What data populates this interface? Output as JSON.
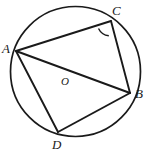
{
  "figure": {
    "type": "circle-geometry-diagram",
    "width": 153,
    "height": 155,
    "background_color": "#ffffff",
    "stroke_color": "#1a1a1a",
    "circle": {
      "name": "circumscribed-circle",
      "cx": 75.5,
      "cy": 71.5,
      "r": 65,
      "stroke_width": 1.6
    },
    "center_point": {
      "name": "O",
      "label": "O",
      "label_x": 61,
      "label_y": 76
    },
    "vertices": [
      {
        "name": "A",
        "label": "A",
        "x": 16,
        "y": 51,
        "label_x": 2,
        "label_y": 42
      },
      {
        "name": "C",
        "label": "C",
        "x": 111,
        "y": 21,
        "label_x": 112,
        "label_y": 5
      },
      {
        "name": "B",
        "label": "B",
        "x": 130,
        "y": 93,
        "label_x": 135,
        "label_y": 88
      },
      {
        "name": "D",
        "label": "D",
        "x": 58,
        "y": 132,
        "label_x": 52,
        "label_y": 139
      }
    ],
    "segments": [
      {
        "name": "segment-AC",
        "from": "A",
        "to": "C",
        "x1": 16,
        "y1": 51,
        "x2": 111,
        "y2": 21
      },
      {
        "name": "segment-CB",
        "from": "C",
        "to": "B",
        "x1": 111,
        "y1": 21,
        "x2": 130,
        "y2": 93
      },
      {
        "name": "segment-AB",
        "from": "A",
        "to": "B",
        "x1": 16,
        "y1": 51,
        "x2": 130,
        "y2": 93
      },
      {
        "name": "segment-AD",
        "from": "A",
        "to": "D",
        "x1": 16,
        "y1": 51,
        "x2": 58,
        "y2": 132
      },
      {
        "name": "segment-DB",
        "from": "D",
        "to": "B",
        "x1": 58,
        "y1": 132,
        "x2": 130,
        "y2": 93
      }
    ],
    "angle_marks": [
      {
        "name": "angle-ACB-arc",
        "at_vertex": "C",
        "path": "M 98.5 28.5 A 14 14 0 0 0 108.5 35.5",
        "stroke_width": 1.3
      }
    ]
  }
}
